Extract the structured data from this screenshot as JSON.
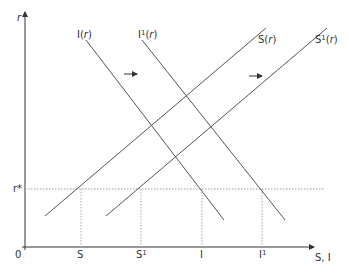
{
  "diagram": {
    "title": "",
    "axes": {
      "y_label": "r",
      "x_label": "S, I",
      "origin_label": "0"
    },
    "curves": [
      {
        "id": "S",
        "label_base": "S",
        "label_sup": "",
        "label_arg": "r",
        "type": "upward"
      },
      {
        "id": "S1",
        "label_base": "S",
        "label_sup": "1",
        "label_arg": "r",
        "type": "upward"
      },
      {
        "id": "I",
        "label_base": "I",
        "label_sup": "",
        "label_arg": "r",
        "type": "downward"
      },
      {
        "id": "I1",
        "label_base": "I",
        "label_sup": "1",
        "label_arg": "r",
        "type": "downward"
      }
    ],
    "world_rate_label": "r*",
    "x_ticks": [
      {
        "base": "S",
        "sup": ""
      },
      {
        "base": "S",
        "sup": "1"
      },
      {
        "base": "I",
        "sup": ""
      },
      {
        "base": "I",
        "sup": "1"
      }
    ],
    "shift_arrows": [
      {
        "description": "investment curve shift right"
      },
      {
        "description": "saving curve shift right"
      }
    ],
    "colors": {
      "axis": "#333333",
      "curve": "#555555",
      "dotted": "#999999"
    }
  }
}
